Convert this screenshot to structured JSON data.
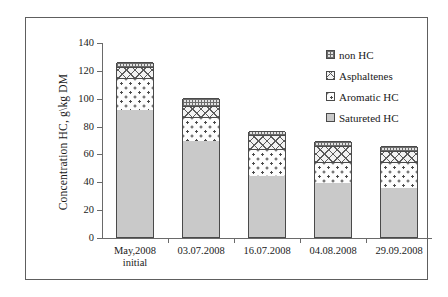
{
  "chart_data": {
    "type": "bar",
    "subtype": "stacked",
    "title": "",
    "xlabel": "",
    "ylabel": "Concentration HC, g\\kg DM",
    "ylim": [
      0,
      140
    ],
    "yticks": [
      0,
      20,
      40,
      60,
      80,
      100,
      120,
      140
    ],
    "grid": false,
    "legend_position": "top-right",
    "categories": [
      "May,2008 initial",
      "03.07.2008",
      "16.07.2008",
      "04.08.2008",
      "29.09.2008"
    ],
    "category_lines": [
      [
        "May,2008",
        "initial"
      ],
      [
        "03.07.2008",
        ""
      ],
      [
        "16.07.2008",
        ""
      ],
      [
        "04.08.2008",
        ""
      ],
      [
        "29.09.2008",
        ""
      ]
    ],
    "series": [
      {
        "name": "Satureted HC",
        "values": [
          91,
          69,
          44,
          39,
          35
        ]
      },
      {
        "name": "Aromatic HC",
        "values": [
          23,
          17,
          19,
          15,
          19
        ]
      },
      {
        "name": "Asphaltenes",
        "values": [
          8,
          8,
          10,
          11,
          8
        ]
      },
      {
        "name": "non HC",
        "values": [
          4,
          6,
          3,
          4,
          3
        ]
      }
    ],
    "totals": [
      126,
      100,
      76,
      69,
      65
    ],
    "series_order_bottom_to_top": [
      "Satureted HC",
      "Aromatic HC",
      "Asphaltenes",
      "non HC"
    ]
  },
  "legend": {
    "items": [
      {
        "label": "non HC",
        "swatch": "fill-nonhc"
      },
      {
        "label": "Asphaltenes",
        "swatch": "fill-asphaltenes"
      },
      {
        "label": "Aromatic HC",
        "swatch": "fill-aromatic"
      },
      {
        "label": "Satureted HC",
        "swatch": "fill-saturated"
      }
    ]
  },
  "colors": {
    "saturated": "#c9c9c9",
    "axis": "#6a6a6a",
    "bar_outline": "#4a4a4a",
    "frame": "#5e5e5e",
    "text": "#1a1a1a",
    "background": "#ffffff"
  }
}
